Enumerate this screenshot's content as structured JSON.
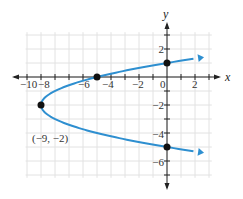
{
  "chart_data": {
    "type": "line",
    "title": "",
    "xlabel": "x",
    "ylabel": "y",
    "xlim": [
      -10.5,
      3.5
    ],
    "ylim": [
      -7.5,
      3.5
    ],
    "grid": true,
    "x_ticks": [
      "-10",
      "-8",
      "-6",
      "-4",
      "-2",
      "0",
      "2"
    ],
    "y_ticks": [
      "2",
      "-2",
      "-4",
      "-6"
    ],
    "series": [
      {
        "name": "x = (y + 2)^2 - 9",
        "equation": "x = (y+2)^2 - 9",
        "color": "#2e8fd0",
        "y_range": [
          -5.3,
          1.3
        ]
      }
    ],
    "points": [
      {
        "x": -9,
        "y": -2
      },
      {
        "x": -5,
        "y": 0
      },
      {
        "x": 0,
        "y": 1
      },
      {
        "x": 0,
        "y": -5
      }
    ],
    "annotations": [
      {
        "text": "(−9, −2)",
        "x": -9,
        "y": -2
      }
    ]
  },
  "labels": {
    "x_axis": "x",
    "y_axis": "y",
    "vertex": "(−9, −2)",
    "xt": [
      "−10",
      "−8",
      "−6",
      "−4",
      "−2",
      "0",
      "2"
    ],
    "yt": [
      "2",
      "−2",
      "−4",
      "−6"
    ]
  }
}
